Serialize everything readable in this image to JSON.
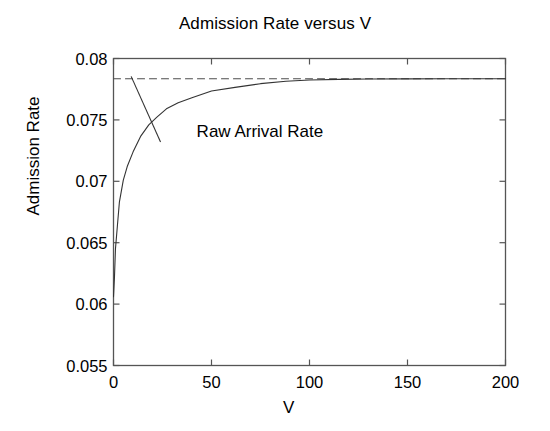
{
  "chart_data": {
    "type": "line",
    "title": "Admission Rate versus V",
    "xlabel": "V",
    "ylabel": "Admission Rate",
    "xlim": [
      0,
      200
    ],
    "ylim": [
      0.055,
      0.08
    ],
    "xticks": [
      0,
      50,
      100,
      150,
      200
    ],
    "xtick_labels": [
      "0",
      "50",
      "100",
      "150",
      "200"
    ],
    "yticks": [
      0.055,
      0.06,
      0.065,
      0.07,
      0.075,
      0.08
    ],
    "ytick_labels": [
      "0.055",
      "0.06",
      "0.065",
      "0.07",
      "0.075",
      "0.08"
    ],
    "grid": false,
    "legend": null,
    "annotations": [
      {
        "text": "Raw Arrival Rate",
        "x": 22,
        "y": 0.0741,
        "points_to_x": 9,
        "points_to_y": 0.0783,
        "leader_line": true
      }
    ],
    "series": [
      {
        "name": "Raw Arrival Rate",
        "style": "dashed",
        "color": "#4d4d4d",
        "description": "Horizontal asymptote at constant raw arrival rate",
        "x": [
          0,
          200
        ],
        "values": [
          0.07835,
          0.07835
        ]
      },
      {
        "name": "Admission Rate",
        "style": "solid",
        "color": "#333333",
        "description": "Admission rate rises steeply from V=0 and saturates at the raw arrival rate",
        "x": [
          0,
          0.5,
          1,
          2,
          3,
          5,
          7,
          10,
          14,
          18,
          22,
          27,
          33,
          40,
          50,
          62,
          75,
          88,
          100,
          115,
          130,
          150,
          170,
          200
        ],
        "values": [
          0.0606,
          0.0622,
          0.0645,
          0.0664,
          0.0683,
          0.0701,
          0.0712,
          0.0724,
          0.0737,
          0.0746,
          0.0752,
          0.0759,
          0.0764,
          0.0768,
          0.07735,
          0.07765,
          0.07795,
          0.07815,
          0.07825,
          0.0783,
          0.07833,
          0.07834,
          0.07835,
          0.07835
        ]
      }
    ]
  },
  "axes": {
    "frame_color": "#555555",
    "background": "#ffffff"
  }
}
